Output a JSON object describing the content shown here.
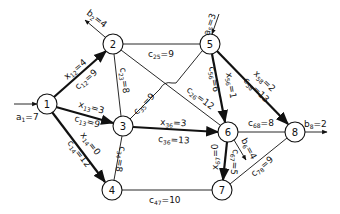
{
  "nodes": [
    {
      "id": "1",
      "label": "1",
      "x": 47,
      "y": 104
    },
    {
      "id": "2",
      "label": "2",
      "x": 113,
      "y": 44
    },
    {
      "id": "3",
      "label": "3",
      "x": 123,
      "y": 126
    },
    {
      "id": "4",
      "label": "4",
      "x": 112,
      "y": 190
    },
    {
      "id": "5",
      "label": "5",
      "x": 210,
      "y": 44
    },
    {
      "id": "6",
      "label": "6",
      "x": 228,
      "y": 132
    },
    {
      "id": "7",
      "label": "7",
      "x": 222,
      "y": 190
    },
    {
      "id": "8",
      "label": "8",
      "x": 295,
      "y": 132
    }
  ],
  "external_flows": [
    {
      "node": "1",
      "symbol": "a",
      "sub": "1",
      "value": "7",
      "text": "a1=7",
      "direction": "in"
    },
    {
      "node": "2",
      "symbol": "b",
      "sub": "2",
      "value": "4",
      "text": "b2=4",
      "direction": "out"
    },
    {
      "node": "5",
      "symbol": "a",
      "sub": "5",
      "value": "3",
      "text": "a5=3",
      "direction": "in"
    },
    {
      "node": "6",
      "symbol": "b",
      "sub": "6",
      "value": "4",
      "text": "b6=4",
      "direction": "out"
    },
    {
      "node": "8",
      "symbol": "b",
      "sub": "8",
      "value": "2",
      "text": "b8=2",
      "direction": "out"
    }
  ],
  "edges": [
    {
      "from": "1",
      "to": "2",
      "cost": "9",
      "flow": "4",
      "cost_label": "c12=9",
      "flow_label": "x12=4"
    },
    {
      "from": "1",
      "to": "3",
      "cost": "9",
      "flow": "3",
      "cost_label": "c13=9",
      "flow_label": "x13=3"
    },
    {
      "from": "1",
      "to": "4",
      "cost": "12",
      "flow": "0",
      "cost_label": "c14=12",
      "flow_label": "x14=0"
    },
    {
      "from": "2",
      "to": "3",
      "cost": "8",
      "flow": null,
      "cost_label": "c23=8"
    },
    {
      "from": "2",
      "to": "5",
      "cost": "9",
      "flow": null,
      "cost_label": "c25=9"
    },
    {
      "from": "2",
      "to": "6",
      "cost": "12",
      "flow": null,
      "cost_label": "c26=12"
    },
    {
      "from": "3",
      "to": "5",
      "cost": "9",
      "flow": null,
      "cost_label": "c35=9"
    },
    {
      "from": "3",
      "to": "6",
      "cost": "13",
      "flow": "3",
      "cost_label": "c36=13",
      "flow_label": "x36=3"
    },
    {
      "from": "3",
      "to": "4",
      "cost": "8",
      "flow": null,
      "cost_label": "c34=8"
    },
    {
      "from": "5",
      "to": "6",
      "cost": "6",
      "flow": "1",
      "cost_label": "c56=6",
      "flow_label": "x56=1"
    },
    {
      "from": "5",
      "to": "8",
      "cost": "13",
      "flow": "2",
      "cost_label": "c58=13",
      "flow_label": "x58=2"
    },
    {
      "from": "6",
      "to": "7",
      "cost": "5",
      "flow": "0",
      "cost_label": "c67=5",
      "flow_label": "x67=0"
    },
    {
      "from": "6",
      "to": "8",
      "cost": "8",
      "flow": null,
      "cost_label": "c68=8"
    },
    {
      "from": "4",
      "to": "7",
      "cost": "10",
      "flow": null,
      "cost_label": "c47=10"
    },
    {
      "from": "7",
      "to": "8",
      "cost": "9",
      "flow": null,
      "cost_label": "c78=9"
    }
  ],
  "labels": {
    "a1": {
      "sym": "a",
      "sub": "1",
      "val": "=7"
    },
    "b2": {
      "sym": "b",
      "sub": "2",
      "val": "=4"
    },
    "a5": {
      "sym": "a",
      "sub": "5",
      "val": "=3"
    },
    "b6": {
      "sym": "b",
      "sub": "6",
      "val": "=4"
    },
    "b8": {
      "sym": "b",
      "sub": "8",
      "val": "=2"
    },
    "x12": {
      "sym": "x",
      "sub": "12",
      "val": "=4"
    },
    "c12": {
      "sym": "c",
      "sub": "12",
      "val": "=9"
    },
    "x13": {
      "sym": "x",
      "sub": "13",
      "val": "=3"
    },
    "c13": {
      "sym": "c",
      "sub": "13",
      "val": "=9"
    },
    "x14": {
      "sym": "x",
      "sub": "14",
      "val": "=0"
    },
    "c14": {
      "sym": "c",
      "sub": "14",
      "val": "=12"
    },
    "c23": {
      "sym": "c",
      "sub": "23",
      "val": "=8"
    },
    "c25": {
      "sym": "c",
      "sub": "25",
      "val": "=9"
    },
    "c26": {
      "sym": "c",
      "sub": "26",
      "val": "=12"
    },
    "c35": {
      "sym": "c",
      "sub": "35",
      "val": "=9"
    },
    "x36": {
      "sym": "x",
      "sub": "36",
      "val": "=3"
    },
    "c36": {
      "sym": "c",
      "sub": "36",
      "val": "=13"
    },
    "c34": {
      "sym": "c",
      "sub": "34",
      "val": "=8"
    },
    "c56": {
      "sym": "c",
      "sub": "56",
      "val": "=6"
    },
    "x56": {
      "sym": "x",
      "sub": "56",
      "val": "=1"
    },
    "x58": {
      "sym": "x",
      "sub": "58",
      "val": "=2"
    },
    "c58": {
      "sym": "c",
      "sub": "58",
      "val": "=13"
    },
    "x67": {
      "sym": "x",
      "sub": "67",
      "val": "=0"
    },
    "c67": {
      "sym": "c",
      "sub": "67",
      "val": "=5"
    },
    "c68": {
      "sym": "c",
      "sub": "68",
      "val": "=8"
    },
    "c47": {
      "sym": "c",
      "sub": "47",
      "val": "=10"
    },
    "c78": {
      "sym": "c",
      "sub": "78",
      "val": "=9"
    }
  }
}
